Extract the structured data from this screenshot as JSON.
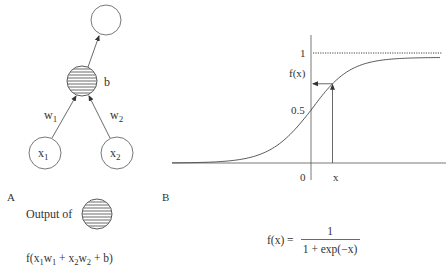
{
  "panel_a": {
    "label": "A",
    "nodes": {
      "output": {
        "label": ""
      },
      "hidden": {
        "bias_label": "b"
      },
      "input1": {
        "label": "x",
        "sub": "1"
      },
      "input2": {
        "label": "x",
        "sub": "2"
      }
    },
    "weights": {
      "w1": {
        "label": "w",
        "sub": "1"
      },
      "w2": {
        "label": "w",
        "sub": "2"
      }
    },
    "caption": {
      "prefix": "Output of",
      "formula": {
        "f_open": "f(x",
        "s1": "1",
        "w1": "w",
        "s2": "1",
        "plus1": " + x",
        "s3": "2",
        "w2": "w",
        "s4": "2",
        "tail": " + b)"
      }
    }
  },
  "panel_b": {
    "label": "B",
    "axis_labels": {
      "y_one": "1",
      "y_fx": "f(x)",
      "y_half": "0.5",
      "x_zero": "0",
      "x_x": "x"
    },
    "formula": {
      "lhs": "f(x) =",
      "numerator": "1",
      "denominator": "1 + exp(−x)"
    }
  },
  "chart_data": {
    "type": "line",
    "title": "",
    "xlabel": "",
    "ylabel": "",
    "function": "f(x) = 1 / (1 + exp(-x))",
    "xlim": [
      -6,
      6
    ],
    "ylim": [
      0,
      1.1
    ],
    "series": [
      {
        "name": "sigmoid",
        "x": [
          -6,
          -4,
          -2,
          -1,
          0,
          1,
          2,
          4,
          6
        ],
        "y": [
          0.0025,
          0.018,
          0.119,
          0.269,
          0.5,
          0.731,
          0.881,
          0.982,
          0.9975
        ]
      }
    ],
    "annotations": [
      {
        "type": "asymptote",
        "y": 1,
        "style": "dotted"
      },
      {
        "type": "marker",
        "x_label": "x",
        "x": 1.0,
        "y_label": "f(x)"
      }
    ],
    "tick_labels": {
      "y": [
        "0.5",
        "1"
      ],
      "x": [
        "0",
        "x"
      ]
    },
    "grid": false
  }
}
